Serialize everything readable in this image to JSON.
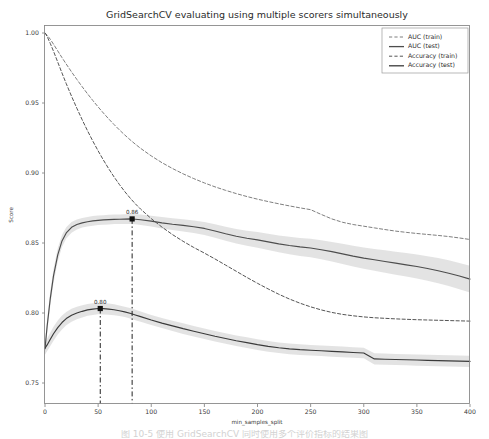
{
  "chart_data": {
    "type": "line",
    "title": "GridSearchCV evaluating using multiple scorers simultaneously",
    "xlabel": "min_samples_split",
    "ylabel": "Score",
    "xlim": [
      0,
      400
    ],
    "ylim": [
      0.735,
      1.005
    ],
    "xticks": [
      0,
      50,
      100,
      150,
      200,
      250,
      300,
      350,
      400
    ],
    "xticklabels": [
      "0",
      "50",
      "100",
      "150",
      "200",
      "250",
      "300",
      "350",
      "400"
    ],
    "yticks": [
      0.75,
      0.8,
      0.85,
      0.9,
      0.95,
      1.0
    ],
    "yticklabels": [
      "0.75",
      "0.80",
      "0.85",
      "0.90",
      "0.95",
      "1.00"
    ],
    "grid": false,
    "legend_position": "upper right",
    "x": [
      0,
      2,
      5,
      8,
      12,
      16,
      20,
      25,
      30,
      35,
      40,
      45,
      50,
      55,
      60,
      65,
      70,
      75,
      80,
      85,
      90,
      100,
      110,
      120,
      130,
      140,
      150,
      160,
      170,
      180,
      190,
      200,
      210,
      220,
      230,
      240,
      250,
      260,
      270,
      280,
      290,
      300,
      310,
      320,
      330,
      340,
      350,
      360,
      370,
      380,
      390,
      400
    ],
    "series": [
      {
        "name": "AUC (train)",
        "style": "dashed",
        "color": "#7f7f7f",
        "band": false,
        "values": [
          1.0,
          0.9985,
          0.9955,
          0.992,
          0.9872,
          0.9824,
          0.9778,
          0.9722,
          0.9668,
          0.9616,
          0.9566,
          0.9518,
          0.9472,
          0.9428,
          0.9386,
          0.9346,
          0.9308,
          0.9272,
          0.9238,
          0.9206,
          0.9176,
          0.9122,
          0.9074,
          0.9032,
          0.8994,
          0.896,
          0.8929,
          0.8901,
          0.8876,
          0.8853,
          0.8832,
          0.8813,
          0.8796,
          0.878,
          0.8765,
          0.8751,
          0.8738,
          0.8704,
          0.8672,
          0.8648,
          0.8632,
          0.862,
          0.8608,
          0.8596,
          0.8585,
          0.8576,
          0.8568,
          0.8561,
          0.8554,
          0.8546,
          0.8536,
          0.8525
        ]
      },
      {
        "name": "AUC (test)",
        "style": "solid",
        "color": "#4d4d4d",
        "band": true,
        "values": [
          0.7745,
          0.7905,
          0.8105,
          0.8265,
          0.8415,
          0.8515,
          0.8572,
          0.8612,
          0.8632,
          0.8644,
          0.8652,
          0.8658,
          0.8662,
          0.8665,
          0.8667,
          0.8669,
          0.867,
          0.8671,
          0.8672,
          0.867,
          0.8666,
          0.8656,
          0.8644,
          0.8634,
          0.8626,
          0.8616,
          0.8604,
          0.8586,
          0.8566,
          0.8548,
          0.8534,
          0.8522,
          0.8508,
          0.8494,
          0.8482,
          0.8472,
          0.8464,
          0.8452,
          0.8438,
          0.8422,
          0.8406,
          0.8392,
          0.838,
          0.8368,
          0.8356,
          0.8344,
          0.8332,
          0.8318,
          0.8302,
          0.8284,
          0.8264,
          0.8242
        ],
        "band_upper": [
          0.779,
          0.7955,
          0.8155,
          0.8315,
          0.8462,
          0.8558,
          0.8612,
          0.865,
          0.8668,
          0.8678,
          0.8686,
          0.8692,
          0.8696,
          0.8699,
          0.8701,
          0.8703,
          0.8704,
          0.8706,
          0.8708,
          0.8706,
          0.8703,
          0.8695,
          0.8685,
          0.8676,
          0.8669,
          0.866,
          0.865,
          0.8634,
          0.8616,
          0.86,
          0.8588,
          0.8578,
          0.8566,
          0.8554,
          0.8544,
          0.8536,
          0.853,
          0.852,
          0.8508,
          0.8494,
          0.848,
          0.8468,
          0.8458,
          0.8448,
          0.8438,
          0.8428,
          0.8418,
          0.8406,
          0.8392,
          0.8376,
          0.8358,
          0.8338
        ],
        "band_lower": [
          0.77,
          0.7855,
          0.8055,
          0.8215,
          0.8368,
          0.8472,
          0.8532,
          0.8574,
          0.8596,
          0.861,
          0.8618,
          0.8624,
          0.8628,
          0.8631,
          0.8633,
          0.8635,
          0.8636,
          0.8636,
          0.8636,
          0.8634,
          0.8629,
          0.8617,
          0.8603,
          0.8592,
          0.8583,
          0.8572,
          0.8558,
          0.8538,
          0.8516,
          0.8496,
          0.848,
          0.8466,
          0.845,
          0.8434,
          0.842,
          0.8408,
          0.8398,
          0.8384,
          0.8368,
          0.835,
          0.8332,
          0.8316,
          0.8302,
          0.8288,
          0.8274,
          0.826,
          0.8246,
          0.823,
          0.8212,
          0.8192,
          0.817,
          0.8146
        ]
      },
      {
        "name": "Accuracy (train)",
        "style": "dashed",
        "color": "#555555",
        "band": false,
        "values": [
          1.0,
          0.9975,
          0.9925,
          0.987,
          0.9792,
          0.9714,
          0.9638,
          0.9548,
          0.9462,
          0.938,
          0.9302,
          0.9228,
          0.9158,
          0.9092,
          0.903,
          0.8972,
          0.8918,
          0.8868,
          0.8822,
          0.878,
          0.8742,
          0.8674,
          0.8614,
          0.856,
          0.8512,
          0.8468,
          0.8428,
          0.8386,
          0.8342,
          0.8298,
          0.8254,
          0.8212,
          0.8172,
          0.8134,
          0.81,
          0.807,
          0.8044,
          0.8022,
          0.8004,
          0.799,
          0.798,
          0.7972,
          0.7966,
          0.7962,
          0.7958,
          0.7955,
          0.7952,
          0.795,
          0.7948,
          0.7946,
          0.7944,
          0.7942
        ]
      },
      {
        "name": "Accuracy (test)",
        "style": "solid",
        "color": "#3a3a3a",
        "band": true,
        "values": [
          0.7748,
          0.7772,
          0.7812,
          0.7852,
          0.7896,
          0.7932,
          0.796,
          0.7984,
          0.8,
          0.8012,
          0.8022,
          0.8028,
          0.8032,
          0.8031,
          0.8028,
          0.8023,
          0.8016,
          0.8008,
          0.7998,
          0.7986,
          0.7974,
          0.795,
          0.7928,
          0.7908,
          0.7888,
          0.787,
          0.7852,
          0.7834,
          0.7818,
          0.7802,
          0.7788,
          0.7774,
          0.7762,
          0.7752,
          0.7744,
          0.7738,
          0.7734,
          0.773,
          0.7726,
          0.7722,
          0.7718,
          0.7714,
          0.7672,
          0.767,
          0.7668,
          0.7666,
          0.7664,
          0.7662,
          0.766,
          0.7658,
          0.7656,
          0.7654
        ],
        "band_upper": [
          0.7793,
          0.7818,
          0.786,
          0.7902,
          0.7946,
          0.7982,
          0.8008,
          0.803,
          0.8045,
          0.8056,
          0.8064,
          0.807,
          0.8073,
          0.8072,
          0.8068,
          0.8062,
          0.8054,
          0.8045,
          0.8035,
          0.8023,
          0.801,
          0.7986,
          0.7964,
          0.7945,
          0.7926,
          0.7908,
          0.789,
          0.7872,
          0.7856,
          0.784,
          0.7826,
          0.7812,
          0.78,
          0.779,
          0.7782,
          0.7776,
          0.7772,
          0.7768,
          0.7764,
          0.776,
          0.7756,
          0.7752,
          0.7712,
          0.771,
          0.7708,
          0.7706,
          0.7704,
          0.7702,
          0.77,
          0.7698,
          0.7696,
          0.7694
        ],
        "band_lower": [
          0.7703,
          0.7726,
          0.7764,
          0.7802,
          0.7846,
          0.7882,
          0.7912,
          0.7938,
          0.7955,
          0.7968,
          0.798,
          0.7986,
          0.7991,
          0.799,
          0.7988,
          0.7984,
          0.7978,
          0.7971,
          0.7961,
          0.7949,
          0.7938,
          0.7914,
          0.7892,
          0.7871,
          0.785,
          0.7832,
          0.7814,
          0.7796,
          0.778,
          0.7764,
          0.775,
          0.7736,
          0.7724,
          0.7714,
          0.7706,
          0.77,
          0.7696,
          0.7692,
          0.7688,
          0.7684,
          0.768,
          0.7676,
          0.7632,
          0.763,
          0.7628,
          0.7626,
          0.7624,
          0.7622,
          0.762,
          0.7618,
          0.7616,
          0.7614
        ]
      }
    ],
    "annotations": [
      {
        "label": "0.86",
        "x": 82,
        "y": 0.8672,
        "series": "AUC (test)"
      },
      {
        "label": "0.80",
        "x": 52,
        "y": 0.8032,
        "series": "Accuracy (test)"
      }
    ],
    "band_color": "#d9d9d9"
  },
  "caption": {
    "text": "图 10-5  使用 GridSearchCV 同时使用多个评价指标的结果图"
  }
}
